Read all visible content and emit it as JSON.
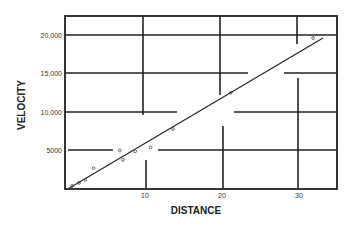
{
  "chart_data": {
    "type": "scatter",
    "title": "",
    "xlabel": "DISTANCE",
    "ylabel": "VELOCITY",
    "xlim": [
      0,
      35
    ],
    "ylim": [
      0,
      22500
    ],
    "x_ticks": [
      {
        "value": 10,
        "label": "10"
      },
      {
        "value": 20,
        "label": "20"
      },
      {
        "value": 30,
        "label": "30"
      }
    ],
    "y_ticks": [
      {
        "value": 5000,
        "label": "5000"
      },
      {
        "value": 10000,
        "label": "10,000"
      },
      {
        "value": 15000,
        "label": "15,000"
      },
      {
        "value": 20000,
        "label": "20,000"
      }
    ],
    "grid": "broken",
    "legend": "none",
    "series": [
      {
        "name": "observations",
        "type": "scatter",
        "points": [
          {
            "x": 0.4,
            "y": 400
          },
          {
            "x": 1.3,
            "y": 800
          },
          {
            "x": 2.1,
            "y": 1200
          },
          {
            "x": 3.2,
            "y": 2700
          },
          {
            "x": 6.6,
            "y": 5000
          },
          {
            "x": 7.0,
            "y": 3800
          },
          {
            "x": 8.6,
            "y": 4900
          },
          {
            "x": 10.6,
            "y": 5400
          },
          {
            "x": 13.5,
            "y": 7800
          },
          {
            "x": 21.0,
            "y": 12500
          },
          {
            "x": 31.7,
            "y": 19600
          }
        ]
      },
      {
        "name": "fit",
        "type": "line",
        "points": [
          {
            "x": 0,
            "y": 100
          },
          {
            "x": 33,
            "y": 19600
          }
        ]
      }
    ],
    "colors": {
      "ink": "#222222",
      "background": "#ffffff"
    }
  }
}
